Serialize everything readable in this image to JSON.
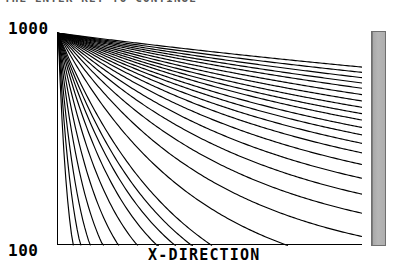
{
  "window": {
    "prompt_text": "THE ENTER KEY TO CONTINUE"
  },
  "axes": {
    "y_max_label": "1000",
    "y_min_label": "100",
    "x_axis_title": "X-DIRECTION",
    "y_axis_title": ""
  },
  "side_strip": {
    "name": "scrollbar-strip",
    "color": "#b0b0b0"
  },
  "chart_data": {
    "type": "line",
    "title": "",
    "subtitle": "",
    "xlabel": "X-DIRECTION",
    "ylabel": "",
    "xlim": [
      0,
      100
    ],
    "ylim": [
      100,
      1000
    ],
    "yscale": "log",
    "grid": false,
    "legend": "none",
    "axis_style": "left-and-bottom-spines",
    "line_color": "#000000",
    "annotations": [],
    "tick_labels": {
      "y": [
        "1000",
        "100"
      ],
      "x": []
    },
    "origin": {
      "x": 0.3,
      "y": 1000
    },
    "series": [
      {
        "name": "curve-01",
        "decay": 0.3,
        "floor": 0.0,
        "x": [
          0,
          5,
          10,
          20,
          30,
          40,
          50,
          60,
          70,
          80,
          90,
          100
        ],
        "values": [
          1000,
          223,
          50,
          3,
          1,
          0,
          0,
          0,
          0,
          0,
          0,
          0
        ]
      },
      {
        "name": "curve-02",
        "decay": 0.2,
        "floor": 0.0,
        "x": [
          0,
          5,
          10,
          20,
          30,
          40,
          50,
          60,
          70,
          80,
          90,
          100
        ],
        "values": [
          1000,
          368,
          135,
          18,
          3,
          1,
          0,
          0,
          0,
          0,
          0,
          0
        ]
      },
      {
        "name": "curve-03",
        "decay": 0.14,
        "floor": 0.0,
        "x": [
          0,
          5,
          10,
          20,
          30,
          40,
          50,
          60,
          70,
          80,
          90,
          100
        ],
        "values": [
          1000,
          497,
          247,
          61,
          15,
          4,
          1,
          0,
          0,
          0,
          0,
          0
        ]
      },
      {
        "name": "curve-04",
        "decay": 0.1,
        "floor": 0.0,
        "x": [
          0,
          5,
          10,
          20,
          30,
          40,
          50,
          60,
          70,
          80,
          90,
          100
        ],
        "values": [
          1000,
          607,
          368,
          135,
          50,
          18,
          7,
          2,
          1,
          0,
          0,
          0
        ]
      },
      {
        "name": "curve-05",
        "decay": 0.074,
        "floor": 0.0,
        "x": [
          0,
          5,
          10,
          20,
          30,
          40,
          50,
          60,
          70,
          80,
          90,
          100
        ],
        "values": [
          1000,
          691,
          477,
          228,
          109,
          52,
          25,
          12,
          6,
          3,
          1,
          1
        ]
      },
      {
        "name": "curve-06",
        "decay": 0.056,
        "floor": 0.0,
        "x": [
          0,
          5,
          10,
          20,
          30,
          40,
          50,
          60,
          70,
          80,
          90,
          100
        ],
        "values": [
          1000,
          756,
          571,
          326,
          186,
          106,
          61,
          35,
          20,
          11,
          6,
          4
        ]
      },
      {
        "name": "curve-07",
        "decay": 0.044,
        "floor": 0.0,
        "x": [
          0,
          5,
          10,
          20,
          30,
          40,
          50,
          60,
          70,
          80,
          90,
          100
        ],
        "values": [
          1000,
          803,
          645,
          416,
          268,
          173,
          111,
          72,
          46,
          30,
          19,
          12
        ]
      },
      {
        "name": "curve-08",
        "decay": 0.036,
        "floor": 0.0,
        "x": [
          0,
          5,
          10,
          20,
          30,
          40,
          50,
          60,
          70,
          80,
          90,
          100
        ],
        "values": [
          1000,
          835,
          697,
          486,
          339,
          236,
          165,
          115,
          80,
          56,
          39,
          27
        ]
      },
      {
        "name": "curve-09",
        "decay": 0.03,
        "floor": 0.0,
        "x": [
          0,
          5,
          10,
          20,
          30,
          40,
          50,
          60,
          70,
          80,
          90,
          100
        ],
        "values": [
          1000,
          861,
          741,
          549,
          407,
          301,
          223,
          165,
          122,
          91,
          67,
          50
        ]
      },
      {
        "name": "curve-10",
        "decay": 0.0255,
        "floor": 0.0,
        "x": [
          0,
          5,
          10,
          20,
          30,
          40,
          50,
          60,
          70,
          80,
          90,
          100
        ],
        "values": [
          1000,
          880,
          775,
          600,
          465,
          360,
          279,
          216,
          168,
          130,
          101,
          78
        ]
      },
      {
        "name": "curve-11",
        "decay": 0.022,
        "floor": 0.0,
        "x": [
          0,
          5,
          10,
          20,
          30,
          40,
          50,
          60,
          70,
          80,
          90,
          100
        ],
        "values": [
          1000,
          896,
          803,
          644,
          518,
          415,
          333,
          267,
          214,
          172,
          138,
          111
        ]
      },
      {
        "name": "curve-12",
        "decay": 0.0192,
        "floor": 0.0,
        "x": [
          0,
          5,
          10,
          20,
          30,
          40,
          50,
          60,
          70,
          80,
          90,
          100
        ],
        "values": [
          1000,
          909,
          826,
          683,
          565,
          466,
          385,
          318,
          263,
          217,
          179,
          148
        ]
      },
      {
        "name": "curve-13",
        "decay": 0.017,
        "floor": 0.0,
        "x": [
          0,
          5,
          10,
          20,
          30,
          40,
          50,
          60,
          70,
          80,
          90,
          100
        ],
        "values": [
          1000,
          919,
          844,
          712,
          601,
          507,
          428,
          361,
          305,
          257,
          217,
          183
        ]
      },
      {
        "name": "curve-14",
        "decay": 0.0152,
        "floor": 0.0,
        "x": [
          0,
          5,
          10,
          20,
          30,
          40,
          50,
          60,
          70,
          80,
          90,
          100
        ],
        "values": [
          1000,
          927,
          859,
          738,
          634,
          545,
          468,
          402,
          345,
          297,
          255,
          219
        ]
      },
      {
        "name": "curve-15",
        "decay": 0.0137,
        "floor": 0.0,
        "x": [
          0,
          5,
          10,
          20,
          30,
          40,
          50,
          60,
          70,
          80,
          90,
          100
        ],
        "values": [
          1000,
          934,
          872,
          760,
          662,
          578,
          504,
          439,
          383,
          334,
          291,
          254
        ]
      },
      {
        "name": "curve-16",
        "decay": 0.0124,
        "floor": 0.0,
        "x": [
          0,
          5,
          10,
          20,
          30,
          40,
          50,
          60,
          70,
          80,
          90,
          100
        ],
        "values": [
          1000,
          940,
          883,
          780,
          688,
          608,
          537,
          474,
          419,
          370,
          327,
          289
        ]
      },
      {
        "name": "curve-17",
        "decay": 0.0113,
        "floor": 0.0,
        "x": [
          0,
          5,
          10,
          20,
          30,
          40,
          50,
          60,
          70,
          80,
          90,
          100
        ],
        "values": [
          1000,
          945,
          893,
          797,
          712,
          636,
          568,
          508,
          453,
          405,
          362,
          323
        ]
      },
      {
        "name": "curve-18",
        "decay": 0.0104,
        "floor": 0.0,
        "x": [
          0,
          5,
          10,
          20,
          30,
          40,
          50,
          60,
          70,
          80,
          90,
          100
        ],
        "values": [
          1000,
          949,
          901,
          812,
          733,
          661,
          596,
          538,
          485,
          437,
          394,
          355
        ]
      },
      {
        "name": "curve-19",
        "decay": 0.0096,
        "floor": 0.0,
        "x": [
          0,
          5,
          10,
          20,
          30,
          40,
          50,
          60,
          70,
          80,
          90,
          100
        ],
        "values": [
          1000,
          953,
          908,
          825,
          752,
          683,
          620,
          563,
          511,
          464,
          421,
          382
        ]
      },
      {
        "name": "curve-20",
        "decay": 0.0089,
        "floor": 0.0,
        "x": [
          0,
          5,
          10,
          20,
          30,
          40,
          50,
          60,
          70,
          80,
          90,
          100
        ],
        "values": [
          1000,
          956,
          914,
          836,
          768,
          703,
          643,
          588,
          538,
          492,
          450,
          411
        ]
      },
      {
        "name": "curve-21",
        "decay": 0.0082,
        "floor": 0.0,
        "x": [
          0,
          5,
          10,
          20,
          30,
          40,
          50,
          60,
          70,
          80,
          90,
          100
        ],
        "values": [
          1000,
          960,
          921,
          848,
          784,
          723,
          667,
          615,
          567,
          523,
          482,
          444
        ]
      },
      {
        "name": "curve-22",
        "decay": 0.0076,
        "floor": 0.0,
        "x": [
          0,
          5,
          10,
          20,
          30,
          40,
          50,
          60,
          70,
          80,
          90,
          100
        ],
        "values": [
          1000,
          963,
          927,
          859,
          798,
          741,
          688,
          639,
          593,
          551,
          511,
          475
        ]
      },
      {
        "name": "curve-23",
        "decay": 0.007,
        "floor": 0.0,
        "x": [
          0,
          5,
          10,
          20,
          30,
          40,
          50,
          60,
          70,
          80,
          90,
          100
        ],
        "values": [
          1000,
          966,
          932,
          870,
          813,
          759,
          709,
          662,
          618,
          577,
          538,
          503
        ]
      },
      {
        "name": "curve-24",
        "decay": 0.0064,
        "floor": 0.0,
        "x": [
          0,
          5,
          10,
          20,
          30,
          40,
          50,
          60,
          70,
          80,
          90,
          100
        ],
        "values": [
          1000,
          969,
          938,
          880,
          827,
          777,
          730,
          686,
          644,
          605,
          569,
          534
        ]
      },
      {
        "name": "curve-25",
        "decay": 0.0058,
        "floor": 0.0,
        "x": [
          0,
          5,
          10,
          20,
          30,
          40,
          50,
          60,
          70,
          80,
          90,
          100
        ],
        "values": [
          1000,
          971,
          943,
          890,
          840,
          793,
          749,
          707,
          668,
          630,
          595,
          561
        ]
      },
      {
        "name": "curve-26",
        "decay": 0.0052,
        "floor": 0.0,
        "x": [
          0,
          5,
          10,
          20,
          30,
          40,
          50,
          60,
          70,
          80,
          90,
          100
        ],
        "values": [
          1000,
          974,
          949,
          900,
          855,
          812,
          771,
          732,
          695,
          660,
          627,
          595
        ]
      },
      {
        "name": "curve-27",
        "decay": 0.0047,
        "floor": 0.0,
        "x": [
          0,
          5,
          10,
          20,
          30,
          40,
          50,
          60,
          70,
          80,
          90,
          100
        ],
        "values": [
          1000,
          977,
          954,
          910,
          868,
          828,
          790,
          753,
          718,
          685,
          654,
          624
        ]
      },
      {
        "name": "curve-28",
        "decay": 0.0042,
        "floor": 0.0,
        "x": [
          0,
          5,
          10,
          20,
          30,
          40,
          50,
          60,
          70,
          80,
          90,
          100
        ],
        "values": [
          1000,
          979,
          959,
          919,
          880,
          843,
          808,
          774,
          741,
          710,
          680,
          651
        ]
      },
      {
        "name": "curve-29",
        "decay": 0.0037,
        "floor": 0.0,
        "x": [
          0,
          5,
          10,
          20,
          30,
          40,
          50,
          60,
          70,
          80,
          90,
          100
        ],
        "values": [
          1000,
          982,
          963,
          928,
          893,
          860,
          828,
          797,
          768,
          739,
          712,
          686
        ]
      },
      {
        "name": "curve-30",
        "decay": 0.0032,
        "floor": 0.0,
        "x": [
          0,
          5,
          10,
          20,
          30,
          40,
          50,
          60,
          70,
          80,
          90,
          100
        ],
        "values": [
          1000,
          984,
          968,
          938,
          908,
          879,
          852,
          825,
          799,
          774,
          749,
          726
        ]
      }
    ]
  }
}
